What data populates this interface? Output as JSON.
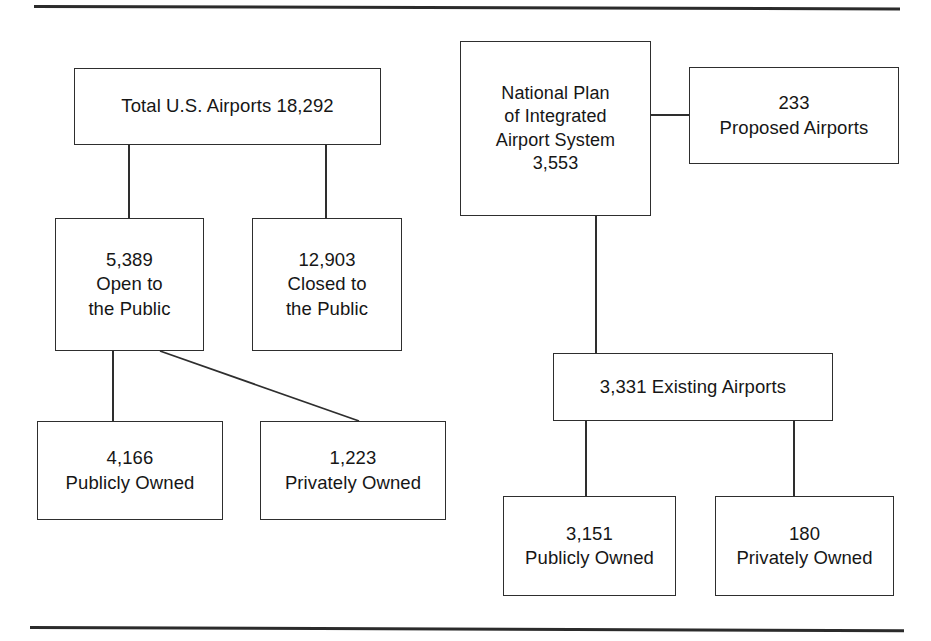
{
  "diagram": {
    "rules": {
      "top": "horizontal-rule",
      "bottom": "horizontal-rule"
    },
    "colors": {
      "background": "#ffffff",
      "line": "#2e2e2e",
      "text": "#161616"
    },
    "left_branch": {
      "root": {
        "name": "total-us-airports",
        "lines": [
          "Total U.S. Airports 18,292"
        ],
        "value": 18292,
        "label": "Total U.S. Airports"
      },
      "children": [
        {
          "name": "open-to-the-public",
          "lines": [
            "5,389",
            "Open to",
            "the Public"
          ],
          "value": 5389,
          "label": "Open to the Public"
        },
        {
          "name": "closed-to-the-public",
          "lines": [
            "12,903",
            "Closed to",
            "the Public"
          ],
          "value": 12903,
          "label": "Closed to the Public"
        }
      ],
      "grandchildren": [
        {
          "name": "left-publicly-owned",
          "lines": [
            "4,166",
            "Publicly Owned"
          ],
          "value": 4166,
          "label": "Publicly Owned"
        },
        {
          "name": "left-privately-owned",
          "lines": [
            "1,223",
            "Privately Owned"
          ],
          "value": 1223,
          "label": "Privately Owned"
        }
      ]
    },
    "right_branch": {
      "root": {
        "name": "national-plan-of-integrated-airport-system",
        "lines": [
          "National Plan",
          "of Integrated",
          "Airport System",
          "3,553"
        ],
        "value": 3553,
        "label": "National Plan of Integrated Airport System"
      },
      "side": {
        "name": "proposed-airports",
        "lines": [
          "233",
          "Proposed Airports"
        ],
        "value": 233,
        "label": "Proposed Airports"
      },
      "children": [
        {
          "name": "existing-airports",
          "lines": [
            "3,331 Existing Airports"
          ],
          "value": 3331,
          "label": "Existing Airports"
        }
      ],
      "grandchildren": [
        {
          "name": "right-publicly-owned",
          "lines": [
            "3,151",
            "Publicly Owned"
          ],
          "value": 3151,
          "label": "Publicly Owned"
        },
        {
          "name": "right-privately-owned",
          "lines": [
            "180",
            "Privately Owned"
          ],
          "value": 180,
          "label": "Privately Owned"
        }
      ]
    },
    "connectors": [
      {
        "name": "total-to-open",
        "type": "vertical"
      },
      {
        "name": "total-to-closed",
        "type": "vertical"
      },
      {
        "name": "open-to-publicly-owned",
        "type": "vertical"
      },
      {
        "name": "open-to-privately-owned",
        "type": "diagonal"
      },
      {
        "name": "npias-to-proposed",
        "type": "horizontal"
      },
      {
        "name": "npias-to-existing",
        "type": "vertical"
      },
      {
        "name": "existing-to-publicly-owned",
        "type": "vertical"
      },
      {
        "name": "existing-to-privately-owned",
        "type": "vertical"
      }
    ]
  }
}
